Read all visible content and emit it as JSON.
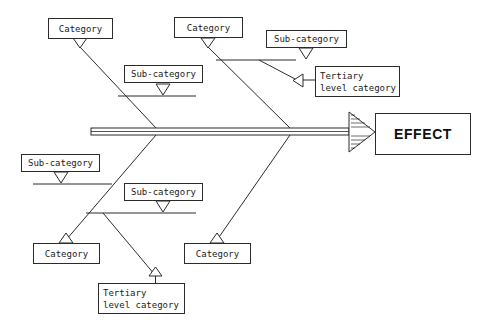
{
  "diagram": {
    "type": "fishbone-ishikawa",
    "title_text": "EFFECT",
    "colors": {
      "stroke": "#2b2b2b",
      "text": "#1a1a1a",
      "background": "#ffffff"
    },
    "effect": {
      "label": "EFFECT"
    },
    "top_branches": [
      {
        "category_label": "Category",
        "sub_label": "Sub-category"
      },
      {
        "category_label": "Category",
        "sub_label": "Sub-category",
        "tertiary_line1": "Tertiary",
        "tertiary_line2": "level category"
      }
    ],
    "bottom_branches": [
      {
        "category_label": "Category",
        "sub_label": "Sub-category",
        "tertiary_line1": "Tertiary",
        "tertiary_line2": "level category"
      },
      {
        "category_label": "Category",
        "sub_label": "Sub-category"
      }
    ],
    "nodes": {
      "top_left_category": "Category",
      "top_mid_category": "Category",
      "top_left_sub": "Sub-category",
      "top_right_sub": "Sub-category",
      "top_tertiary_line1": "Tertiary",
      "top_tertiary_line2": "level category",
      "bottom_left_sub": "Sub-category",
      "bottom_mid_sub": "Sub-category",
      "bottom_left_category": "Category",
      "bottom_right_category": "Category",
      "bottom_tertiary_line1": "Tertiary",
      "bottom_tertiary_line2": "level category"
    }
  }
}
